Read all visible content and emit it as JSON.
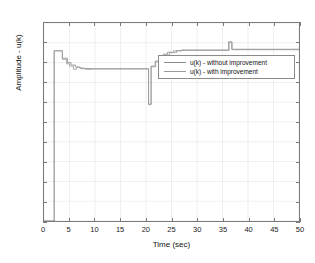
{
  "chart_data": {
    "type": "line",
    "title": "",
    "xlabel": "Time (sec)",
    "ylabel": "Amplitude - u(k)",
    "xlim": [
      0,
      50
    ],
    "ylim": [
      -1,
      1
    ],
    "xticks": [
      "0",
      "5",
      "10",
      "15",
      "20",
      "25",
      "30",
      "35",
      "40",
      "45",
      "50"
    ],
    "yticks": [
      "1",
      "0.8",
      "0.6",
      "0.4",
      "0.2",
      "0",
      "-0.2",
      "-0.4",
      "-0.6",
      "-0.8",
      "-1"
    ],
    "grid": true,
    "legend_position": "center-right",
    "colors": {
      "series1": "#8c8c8c",
      "series2": "#9a9a9a",
      "axis": "#7a7a7a",
      "grid": "#e4e4e4",
      "text": "#111111",
      "background": "#ffffff"
    },
    "series": [
      {
        "name": "u(k) - without improvement",
        "step": true,
        "x": [
          0,
          2.0,
          2.0,
          3.6,
          3.6,
          4.6,
          4.6,
          5.3,
          5.3,
          6.2,
          6.2,
          7.0,
          7.0,
          8.0,
          8.0,
          9.2,
          9.2,
          20.5,
          20.5,
          21.0,
          21.0,
          21.8,
          21.8,
          22.6,
          22.6,
          23.4,
          23.4,
          24.2,
          24.2,
          25.4,
          25.4,
          27.0,
          27.0,
          36.2,
          36.2,
          36.8,
          36.8,
          50
        ],
        "y": [
          -1,
          -1,
          0.72,
          0.72,
          0.645,
          0.645,
          0.6,
          0.6,
          0.575,
          0.575,
          0.555,
          0.555,
          0.545,
          0.545,
          0.54,
          0.54,
          0.538,
          0.538,
          0.18,
          0.18,
          0.565,
          0.565,
          0.615,
          0.615,
          0.655,
          0.655,
          0.685,
          0.685,
          0.705,
          0.705,
          0.718,
          0.718,
          0.728,
          0.728,
          0.81,
          0.81,
          0.735,
          0.735
        ]
      },
      {
        "name": "u(k) - with improvement",
        "step": true,
        "x": [
          0,
          2.0,
          2.0,
          3.6,
          3.6,
          4.4,
          4.4,
          5.0,
          5.0,
          5.8,
          5.8,
          6.4,
          6.4,
          7.2,
          7.2,
          8.2,
          8.2,
          9.4,
          9.4,
          20.5,
          20.5,
          21.0,
          21.0,
          21.9,
          21.9,
          22.8,
          22.8,
          23.6,
          23.6,
          24.6,
          24.6,
          26.0,
          26.0,
          36.3,
          36.3,
          36.9,
          36.9,
          50
        ],
        "y": [
          -1,
          -1,
          0.718,
          0.718,
          0.632,
          0.632,
          0.588,
          0.588,
          0.565,
          0.565,
          0.533,
          0.533,
          0.552,
          0.552,
          0.538,
          0.538,
          0.532,
          0.532,
          0.536,
          0.536,
          0.175,
          0.175,
          0.558,
          0.558,
          0.608,
          0.608,
          0.648,
          0.648,
          0.678,
          0.678,
          0.7,
          0.7,
          0.722,
          0.722,
          0.805,
          0.805,
          0.73,
          0.73
        ]
      }
    ],
    "annotations": []
  }
}
